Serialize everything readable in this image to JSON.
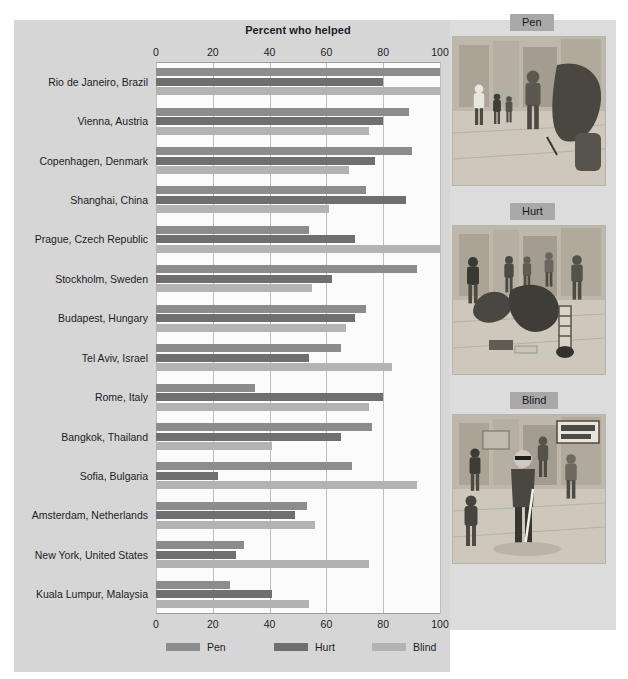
{
  "chart_data": {
    "type": "bar",
    "orientation": "horizontal",
    "title": "Percent who helped",
    "xlabel": "",
    "ylabel": "",
    "xlim": [
      0,
      100
    ],
    "xticks": [
      0,
      20,
      40,
      60,
      80,
      100
    ],
    "grid": true,
    "legend_position": "bottom",
    "categories": [
      "Rio de Janeiro, Brazil",
      "Vienna, Austria",
      "Copenhagen, Denmark",
      "Shanghai, China",
      "Prague, Czech Republic",
      "Stockholm, Sweden",
      "Budapest, Hungary",
      "Tel Aviv, Israel",
      "Rome, Italy",
      "Bangkok, Thailand",
      "Sofia, Bulgaria",
      "Amsterdam, Netherlands",
      "New York, United States",
      "Kuala Lumpur, Malaysia"
    ],
    "series": [
      {
        "name": "Pen",
        "color": "#8c8c8c",
        "values": [
          100,
          89,
          90,
          74,
          54,
          92,
          74,
          65,
          35,
          76,
          69,
          53,
          31,
          26
        ]
      },
      {
        "name": "Hurt",
        "color": "#6f6f6f",
        "values": [
          80,
          80,
          77,
          88,
          70,
          62,
          70,
          54,
          80,
          65,
          22,
          49,
          28,
          41
        ]
      },
      {
        "name": "Blind",
        "color": "#b3b3b3",
        "values": [
          100,
          75,
          68,
          61,
          100,
          55,
          67,
          83,
          75,
          41,
          92,
          56,
          75,
          54
        ]
      }
    ]
  },
  "legend": {
    "items": [
      {
        "label": "Pen"
      },
      {
        "label": "Hurt"
      },
      {
        "label": "Blind"
      }
    ]
  },
  "illustrations": [
    {
      "tag": "Pen",
      "description": "Sketch of a man walking on a sidewalk dropping a pen, with pedestrians behind him"
    },
    {
      "tag": "Hurt",
      "description": "Sketch of a person with a leg brace bending to pick up dropped magazines while passersby help"
    },
    {
      "tag": "Blind",
      "description": "Sketch of a blind man with sunglasses and a white cane at a street crossing with a DON'T WALK sign"
    }
  ]
}
